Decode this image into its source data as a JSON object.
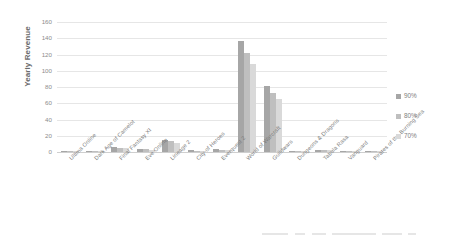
{
  "chart_data": {
    "type": "bar",
    "title": "",
    "xlabel": "",
    "ylabel": "Yearly Revenue",
    "ylim": [
      0,
      160
    ],
    "yticks": [
      0,
      20,
      40,
      60,
      80,
      100,
      120,
      140,
      160
    ],
    "grid": true,
    "legend_position": "right",
    "categories": [
      "Ultima Online",
      "Dark Age of Camelot",
      "Final Fantasy XI",
      "Eve Online",
      "Lineage 2",
      "City of Heroes",
      "Everquest 2",
      "World of Warcraft",
      "Guildwars",
      "Dungeons & Dragons",
      "Tabula Rasa",
      "Vanguard",
      "Pirates of the Burning Sea"
    ],
    "series": [
      {
        "name": "90%",
        "color": "#a6a6a6",
        "values": [
          1.5,
          0.8,
          6,
          4,
          14.5,
          2,
          3.5,
          137,
          81,
          1,
          2.5,
          0.8,
          0.6
        ]
      },
      {
        "name": "80%",
        "color": "#bfbfbf",
        "values": [
          1.3,
          0.7,
          5.2,
          3.5,
          13,
          1.8,
          3,
          122,
          73,
          0.9,
          2.2,
          0.7,
          0.5
        ]
      },
      {
        "name": "70%",
        "color": "#d9d9d9",
        "values": [
          1.1,
          0.6,
          4.5,
          3,
          11.5,
          1.5,
          2.6,
          108,
          65,
          0.8,
          1.9,
          0.6,
          0.4
        ]
      }
    ]
  },
  "axis": {
    "y_title": "Yearly Revenue"
  },
  "legend": {
    "items": [
      {
        "label": "90%",
        "color": "#a6a6a6"
      },
      {
        "label": "80%",
        "color": "#bfbfbf"
      },
      {
        "label": "70%",
        "color": "#d9d9d9"
      }
    ]
  },
  "colors": {
    "series_90": "#a6a6a6",
    "series_80": "#bfbfbf",
    "series_70": "#d9d9d9",
    "gridline": "#e6e6e6",
    "tick_text": "#8c8c8c",
    "label_text": "#7a7a7a",
    "background": "#ffffff"
  }
}
